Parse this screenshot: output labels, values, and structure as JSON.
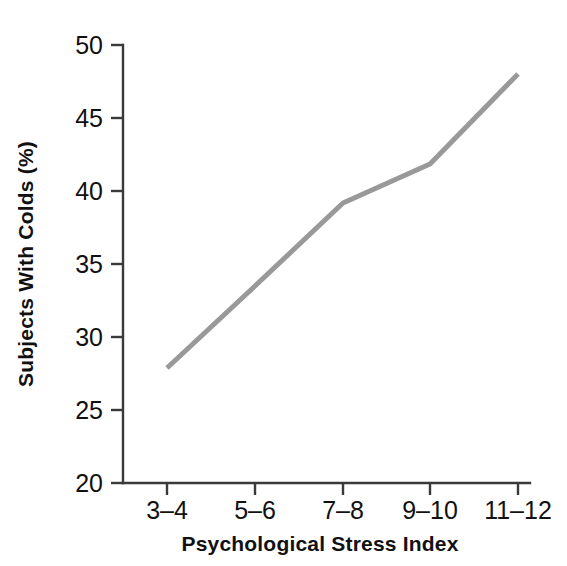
{
  "chart_data": {
    "type": "line",
    "title": "",
    "subtitle": "",
    "xlabel": "Psychological Stress Index",
    "ylabel": "Subjects With Colds (%)",
    "categories": [
      "3–4",
      "5–6",
      "7–8",
      "9–10",
      "11–12"
    ],
    "values": [
      27.8,
      33.4,
      38.9,
      41.6,
      47.6
    ],
    "series": [
      {
        "name": "Subjects With Colds (%)",
        "values": [
          27.8,
          33.4,
          38.9,
          41.6,
          47.6
        ],
        "color": "#999999"
      }
    ],
    "ylim": [
      20,
      50
    ],
    "yticks": [
      20,
      25,
      30,
      35,
      40,
      45,
      50
    ],
    "ytick_labels": [
      "20",
      "25",
      "30",
      "35",
      "40",
      "45",
      "50"
    ],
    "xtick_labels": [
      "3–4",
      "5–6",
      "7–8",
      "9–10",
      "11–12"
    ],
    "grid": false,
    "legend": false,
    "legend_position": "none",
    "line_color": "#999999",
    "line_width": 5,
    "axis_color": "#3a3a3a",
    "background_color": "#ffffff"
  },
  "yaxis": {
    "label": "Subjects With Colds (%)",
    "ticks": [
      {
        "value": "50",
        "y": 45
      },
      {
        "value": "45",
        "y": 118
      },
      {
        "value": "40",
        "y": 191
      },
      {
        "value": "35",
        "y": 264
      },
      {
        "value": "30",
        "y": 337
      },
      {
        "value": "25",
        "y": 410
      },
      {
        "value": "20",
        "y": 483
      }
    ]
  },
  "xaxis": {
    "label": "Psychological Stress Index",
    "ticks": [
      {
        "value": "3–4",
        "x": 167
      },
      {
        "value": "5–6",
        "x": 255
      },
      {
        "value": "7–8",
        "x": 343
      },
      {
        "value": "9–10",
        "x": 430
      },
      {
        "value": "11–12",
        "x": 518
      }
    ]
  },
  "points": [
    {
      "x": 167,
      "y": 368,
      "value": 27.8,
      "category": "3–4"
    },
    {
      "x": 255,
      "y": 286,
      "value": 33.4,
      "category": "5–6"
    },
    {
      "x": 343,
      "y": 203,
      "value": 38.9,
      "category": "7–8"
    },
    {
      "x": 430,
      "y": 164,
      "value": 41.6,
      "category": "9–10"
    },
    {
      "x": 518,
      "y": 74,
      "value": 47.6,
      "category": "11–12"
    }
  ]
}
